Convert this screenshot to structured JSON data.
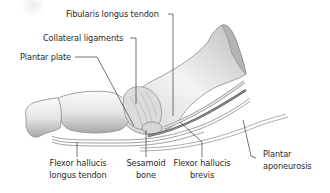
{
  "diagram": {
    "colors": {
      "background": "#ffffff",
      "bone_light": "#f2f2f2",
      "bone_mid": "#c8c8c8",
      "bone_dark": "#8a8a8a",
      "leader_line": "#3a3a3a",
      "label_text": "#2a2a2a"
    },
    "labels": [
      {
        "id": "fibularis",
        "text": "Fibularis longus tendon"
      },
      {
        "id": "collateral",
        "text": "Collateral ligaments"
      },
      {
        "id": "plantar_plate",
        "text": "Plantar plate"
      },
      {
        "id": "fhl_line1",
        "text": "Flexor hallucis"
      },
      {
        "id": "fhl_line2",
        "text": "longus tendon"
      },
      {
        "id": "sesamoid_line1",
        "text": "Sesamoid"
      },
      {
        "id": "sesamoid_line2",
        "text": "bone"
      },
      {
        "id": "fhb_line1",
        "text": "Flexor hallucis"
      },
      {
        "id": "fhb_line2",
        "text": "brevis"
      },
      {
        "id": "aponeurosis_line1",
        "text": "Plantar"
      },
      {
        "id": "aponeurosis_line2",
        "text": "aponeurosis"
      }
    ]
  }
}
